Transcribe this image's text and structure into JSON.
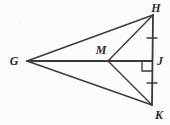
{
  "figure": {
    "name": "kite-GHKM-with-diagonal",
    "background_color": "#fcfcfc",
    "stroke_color": "#3a3a3a",
    "label_color": "#2b2b2b",
    "points": {
      "G": {
        "label": "G",
        "x": 27,
        "y": 61,
        "label_x": 14,
        "label_y": 65
      },
      "H": {
        "label": "H",
        "x": 153,
        "y": 15,
        "label_x": 152,
        "label_y": 13
      },
      "M": {
        "label": "M",
        "x": 108,
        "y": 61,
        "label_x": 96,
        "label_y": 54
      },
      "J": {
        "label": "J",
        "x": 152,
        "y": 61,
        "label_x": 157,
        "label_y": 64
      },
      "K": {
        "label": "K",
        "x": 152,
        "y": 105,
        "label_x": 152,
        "label_y": 120
      }
    },
    "segments": [
      {
        "name": "segment-GH",
        "from": "G",
        "to": "H"
      },
      {
        "name": "segment-GK",
        "from": "G",
        "to": "K"
      },
      {
        "name": "segment-GJ",
        "from": "G",
        "to": "J"
      },
      {
        "name": "segment-MH",
        "from": "M",
        "to": "H"
      },
      {
        "name": "segment-MK",
        "from": "M",
        "to": "K"
      },
      {
        "name": "segment-HK",
        "from": "H",
        "to": "K"
      }
    ],
    "tick_marks": [
      {
        "name": "congruence-tick-HJ",
        "x": 152,
        "y": 38,
        "half_width": 5
      },
      {
        "name": "congruence-tick-JK",
        "x": 152,
        "y": 83,
        "half_width": 5
      }
    ],
    "right_angle": {
      "name": "right-angle-at-J",
      "vertex_x": 152,
      "vertex_y": 61,
      "size": 10,
      "direction_x": -1,
      "direction_y": 1
    }
  }
}
